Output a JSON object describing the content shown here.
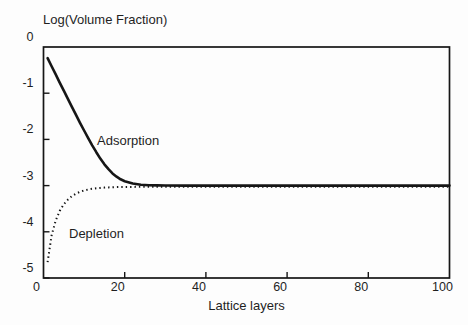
{
  "figure": {
    "title": "Log(Volume Fraction)",
    "x_axis_title": "Lattice layers"
  },
  "annotations": {
    "adsorption_label": "Adsorption",
    "depletion_label": "Depletion"
  },
  "axes": {
    "x_tick_labels": [
      "0",
      "20",
      "40",
      "60",
      "80",
      "100"
    ],
    "y_tick_labels": [
      "0",
      "-1",
      "-2",
      "-3",
      "-4",
      "-5"
    ]
  },
  "colors": {
    "line": "#161616",
    "frame": "#161616",
    "text": "#232323",
    "background": "#fdfdfd"
  },
  "chart_data": {
    "type": "line",
    "title": "Log(Volume Fraction)",
    "xlabel": "Lattice layers",
    "ylabel": "Log(Volume Fraction)",
    "xlim": [
      0,
      100
    ],
    "ylim": [
      -5,
      0
    ],
    "x_ticks": [
      0,
      20,
      40,
      60,
      80,
      100
    ],
    "y_ticks": [
      0,
      -1,
      -2,
      -3,
      -4,
      -5
    ],
    "grid": false,
    "legend": "in-plot text labels",
    "bulk_asymptote": -3.0,
    "series": [
      {
        "name": "Adsorption",
        "style": "solid",
        "x": [
          1,
          2,
          3,
          4,
          5,
          6,
          7,
          8,
          9,
          10,
          11,
          12,
          13,
          14,
          15,
          16,
          17,
          18,
          19,
          20,
          22,
          24,
          26,
          28,
          30,
          35,
          40,
          50,
          60,
          70,
          80,
          90,
          100
        ],
        "y": [
          -0.24,
          -0.417,
          -0.594,
          -0.77,
          -0.946,
          -1.122,
          -1.296,
          -1.469,
          -1.64,
          -1.808,
          -1.971,
          -2.128,
          -2.277,
          -2.415,
          -2.538,
          -2.646,
          -2.736,
          -2.808,
          -2.863,
          -2.904,
          -2.955,
          -2.98,
          -2.991,
          -2.996,
          -2.998,
          -3.0,
          -3.0,
          -3.0,
          -3.0,
          -3.0,
          -3.0,
          -3.0,
          -3.0
        ]
      },
      {
        "name": "Depletion",
        "style": "dotted",
        "x": [
          1,
          2,
          3,
          4,
          5,
          6,
          7,
          8,
          9,
          10,
          11,
          12,
          13,
          14,
          15,
          16,
          17,
          18,
          19,
          20,
          22,
          24,
          26,
          28,
          30,
          35,
          40,
          50,
          60,
          70,
          80,
          90,
          100
        ],
        "y": [
          -4.633,
          -4.051,
          -3.731,
          -3.523,
          -3.379,
          -3.277,
          -3.202,
          -3.148,
          -3.109,
          -3.08,
          -3.059,
          -3.044,
          -3.032,
          -3.023,
          -3.017,
          -3.013,
          -3.009,
          -3.007,
          -3.005,
          -3.004,
          -3.002,
          -3.001,
          -3.001,
          -3.0,
          -3.0,
          -3.0,
          -3.0,
          -3.0,
          -3.0,
          -3.0,
          -3.0,
          -3.0,
          -3.0
        ]
      }
    ]
  }
}
